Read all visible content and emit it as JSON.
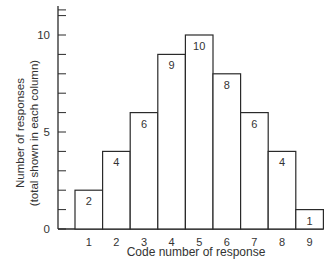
{
  "chart_data": {
    "type": "bar",
    "title": "",
    "xlabel": "Code number of response",
    "ylabel": "Number of responses",
    "ylabel_sub": "(total shown in each column)",
    "categories": [
      "1",
      "2",
      "3",
      "4",
      "5",
      "6",
      "7",
      "8",
      "9"
    ],
    "values": [
      2,
      4,
      6,
      9,
      10,
      8,
      6,
      4,
      1
    ],
    "data_labels": [
      "2",
      "4",
      "6",
      "9",
      "10",
      "8",
      "6",
      "4",
      "1"
    ],
    "ylim": [
      0,
      11.5
    ],
    "y_ticks_major": [
      0,
      5,
      10
    ],
    "y_tick_labels": [
      "0",
      "5",
      "10"
    ],
    "y_ticks_minor_step": 1,
    "grid": false,
    "legend": null,
    "style": "histogram, adjacent bars, white fill, black outline"
  }
}
